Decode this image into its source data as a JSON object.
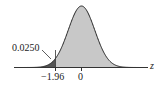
{
  "chart_data": {
    "type": "area",
    "title": "",
    "xlabel": "z",
    "ylabel": "",
    "distribution": "standard normal",
    "tick_labels": [
      "−1.96",
      "0"
    ],
    "tick_values": [
      -1.96,
      0
    ],
    "xlim": [
      -3.5,
      3.5
    ],
    "shaded_regions": [
      {
        "name": "left tail",
        "from": -3.5,
        "to": -1.96,
        "area": 0.025,
        "color": "#555555"
      },
      {
        "name": "remaining",
        "from": -1.96,
        "to": 3.5,
        "area": 0.975,
        "color": "#c8c8c8"
      }
    ],
    "annotations": [
      {
        "text": "0.0250",
        "points_to": "left tail"
      }
    ],
    "grid": false,
    "legend": "none"
  },
  "labels": {
    "area_annotation": "0.0250",
    "tick_neg": "−1.96",
    "tick_zero": "0",
    "axis": "z"
  },
  "colors": {
    "tail": "#555555",
    "body": "#c8c8c8",
    "curve": "#222222"
  }
}
